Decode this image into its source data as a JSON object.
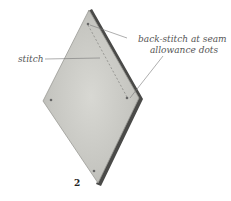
{
  "figure": {
    "number": "2",
    "annotations": {
      "stitch": "stitch",
      "backstitch_line1": "back-stitch at seam",
      "backstitch_line2": "allowance dots"
    },
    "colors": {
      "fabric_front": "#c9c9c4",
      "fabric_back": "#4a4a48",
      "fabric_edge": "#9a9a95",
      "stitch_line": "#8a8a86",
      "leader_line": "#777777",
      "text": "#555555"
    }
  }
}
